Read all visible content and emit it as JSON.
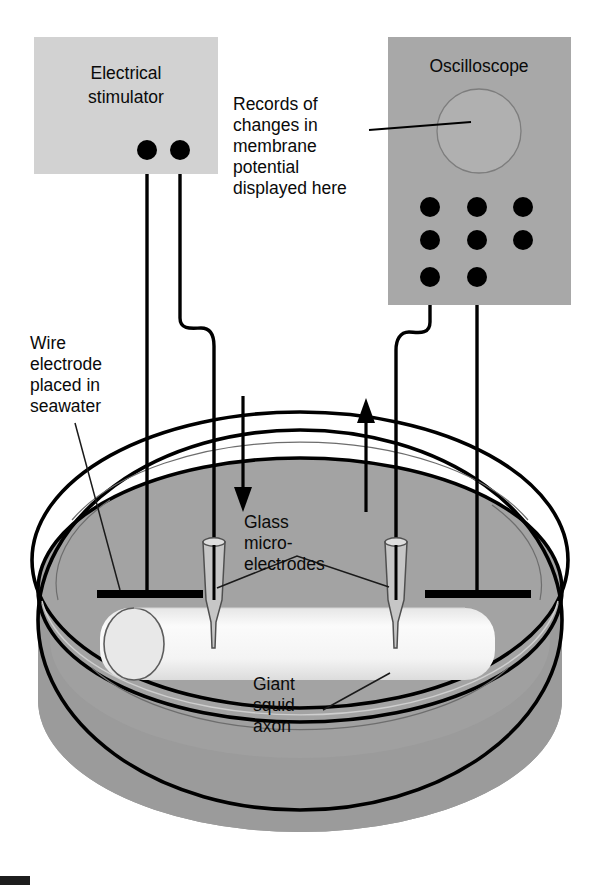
{
  "figure": {
    "background_color": "#ffffff"
  },
  "stimulator_panel": {
    "label_line1": "Electrical",
    "label_line2": "stimulator",
    "fill_color": "#d2d2d2",
    "terminals": 2
  },
  "oscilloscope_panel": {
    "label": "Oscilloscope",
    "fill_color": "#a8a8a8",
    "screen_shape": "circle",
    "connector_dots": 8
  },
  "annotations": {
    "records": {
      "line1": "Records of",
      "line2": "changes in",
      "line3": "membrane",
      "line4": "potential",
      "line5": "displayed here"
    },
    "wire_electrode": {
      "line1": "Wire",
      "line2": "electrode",
      "line3": "placed in",
      "line4": "seawater"
    },
    "microelectrodes": {
      "line1": "Glass",
      "line2": "micro-",
      "line3": "electrodes"
    },
    "axon": {
      "line1": "Giant",
      "line2": "squid",
      "line3": "axon"
    }
  },
  "dish": {
    "rim_color": "#ffffff",
    "seawater_color": "#a3a3a3",
    "wall_color": "#9a9a9a",
    "outline_color": "#000000"
  },
  "axon": {
    "body_color": "#f2f2f2",
    "cap_color": "#e4e4e4",
    "outline_color": "#5a5a5a"
  },
  "flow_arrows": {
    "stimulus_direction": "down",
    "recording_direction": "up",
    "color": "#000000"
  },
  "electrodes": {
    "wire_bar_color": "#000000",
    "pipette_fill": "#c8c8c8",
    "pipette_outline": "#4a4a4a",
    "count_wire_bars": 2,
    "count_pipettes": 2
  }
}
